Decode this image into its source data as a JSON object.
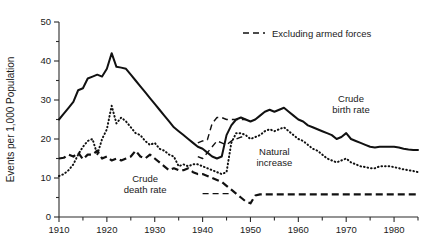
{
  "chart_data": {
    "type": "line",
    "title": "",
    "xlabel": "",
    "ylabel": "Events per 1,000 Population",
    "xlim": [
      1910,
      1985
    ],
    "ylim": [
      0,
      50
    ],
    "grid": false,
    "x_ticks_major": [
      1910,
      1920,
      1930,
      1940,
      1950,
      1960,
      1970,
      1980
    ],
    "x_ticks_minor": [
      1915,
      1925,
      1935,
      1945,
      1955,
      1965,
      1975,
      1985
    ],
    "y_ticks_major": [
      0,
      10,
      20,
      30,
      40,
      50
    ],
    "y_ticks_minor": [
      5,
      15,
      25,
      35,
      45
    ],
    "legend": {
      "position": "top-right",
      "entries": [
        {
          "label": "Excluding armed forces",
          "style": "dashed-thin"
        }
      ]
    },
    "annotations": [
      {
        "text": "Crude birth rate",
        "x": 1971,
        "y": 29.5
      },
      {
        "text": "Crude death rate",
        "x": 1928,
        "y": 9.0
      },
      {
        "text": "Natural increase",
        "x": 1955,
        "y": 16.0
      }
    ],
    "series": [
      {
        "name": "Crude birth rate",
        "style": "solid",
        "x": [
          1910,
          1911,
          1912,
          1913,
          1914,
          1915,
          1916,
          1917,
          1918,
          1919,
          1920,
          1921,
          1922,
          1923,
          1924,
          1925,
          1926,
          1927,
          1928,
          1929,
          1930,
          1931,
          1932,
          1933,
          1934,
          1935,
          1936,
          1937,
          1938,
          1939,
          1940,
          1941,
          1942,
          1943,
          1944,
          1945,
          1946,
          1947,
          1948,
          1949,
          1950,
          1951,
          1952,
          1953,
          1954,
          1955,
          1956,
          1957,
          1958,
          1959,
          1960,
          1961,
          1962,
          1963,
          1964,
          1965,
          1966,
          1967,
          1968,
          1969,
          1970,
          1971,
          1972,
          1973,
          1974,
          1975,
          1976,
          1977,
          1978,
          1979,
          1980,
          1981,
          1982,
          1983,
          1984,
          1985
        ],
        "values": [
          25.0,
          26.5,
          28.0,
          29.5,
          32.5,
          33.0,
          35.5,
          36.0,
          36.5,
          36.0,
          38.0,
          42.0,
          38.5,
          38.3,
          38.0,
          36.5,
          35.0,
          33.5,
          32.0,
          30.5,
          29.0,
          27.5,
          26.0,
          24.5,
          23.0,
          22.0,
          21.0,
          20.0,
          19.0,
          18.0,
          17.5,
          16.5,
          15.5,
          15.0,
          15.5,
          21.0,
          23.5,
          25.0,
          25.5,
          25.0,
          24.5,
          25.0,
          26.0,
          27.0,
          27.5,
          27.0,
          27.5,
          28.0,
          27.0,
          26.0,
          25.0,
          24.5,
          23.5,
          23.0,
          22.5,
          22.0,
          21.5,
          21.0,
          20.0,
          20.5,
          21.5,
          20.0,
          19.5,
          19.0,
          18.5,
          18.0,
          17.8,
          18.0,
          18.0,
          18.0,
          18.0,
          17.8,
          17.5,
          17.3,
          17.2,
          17.2
        ]
      },
      {
        "name": "Natural increase",
        "style": "dotted",
        "x": [
          1910,
          1911,
          1912,
          1913,
          1914,
          1915,
          1916,
          1917,
          1918,
          1919,
          1920,
          1921,
          1922,
          1923,
          1924,
          1925,
          1926,
          1927,
          1928,
          1929,
          1930,
          1931,
          1932,
          1933,
          1934,
          1935,
          1936,
          1937,
          1938,
          1939,
          1940,
          1941,
          1942,
          1943,
          1944,
          1945,
          1946,
          1947,
          1948,
          1949,
          1950,
          1951,
          1952,
          1953,
          1954,
          1955,
          1956,
          1957,
          1958,
          1959,
          1960,
          1961,
          1962,
          1963,
          1964,
          1965,
          1966,
          1967,
          1968,
          1969,
          1970,
          1971,
          1972,
          1973,
          1974,
          1975,
          1976,
          1977,
          1978,
          1979,
          1980,
          1981,
          1982,
          1983,
          1984,
          1985
        ],
        "values": [
          10.5,
          11.0,
          12.0,
          13.5,
          16.0,
          18.0,
          19.5,
          20.0,
          16.0,
          20.0,
          22.5,
          28.5,
          24.0,
          25.5,
          24.5,
          23.0,
          21.5,
          21.0,
          19.5,
          18.5,
          19.0,
          17.5,
          17.0,
          16.0,
          15.5,
          13.0,
          13.5,
          13.0,
          13.5,
          13.5,
          13.0,
          12.5,
          12.0,
          11.5,
          11.0,
          11.5,
          19.0,
          21.5,
          21.5,
          21.0,
          20.0,
          20.5,
          21.0,
          22.0,
          22.5,
          22.0,
          22.5,
          23.0,
          22.0,
          21.0,
          20.0,
          19.5,
          18.5,
          17.5,
          17.0,
          16.0,
          15.0,
          14.5,
          14.0,
          14.5,
          15.0,
          14.0,
          13.5,
          13.0,
          12.8,
          12.5,
          12.5,
          13.0,
          13.0,
          13.0,
          12.8,
          12.5,
          12.2,
          12.0,
          11.8,
          11.5
        ]
      },
      {
        "name": "Crude death rate",
        "style": "dashed",
        "x": [
          1910,
          1911,
          1912,
          1913,
          1914,
          1915,
          1916,
          1917,
          1918,
          1919,
          1920,
          1921,
          1922,
          1923,
          1924,
          1925,
          1926,
          1927,
          1928,
          1929,
          1930,
          1931,
          1932,
          1933,
          1934,
          1935,
          1936,
          1937,
          1938,
          1939,
          1940,
          1941,
          1942,
          1943,
          1944,
          1945,
          1946,
          1947,
          1948,
          1949,
          1950,
          1951,
          1952,
          1953,
          1954,
          1955,
          1956,
          1957,
          1958,
          1959,
          1960,
          1961,
          1962,
          1963,
          1964,
          1965,
          1966,
          1967,
          1968,
          1969,
          1970,
          1971,
          1972,
          1973,
          1974,
          1975,
          1976,
          1977,
          1978,
          1979,
          1980,
          1981,
          1982,
          1983,
          1984,
          1985
        ],
        "values": [
          15.0,
          15.2,
          16.0,
          15.5,
          16.5,
          14.8,
          16.0,
          16.0,
          17.0,
          15.0,
          15.5,
          14.5,
          15.0,
          14.5,
          15.0,
          15.5,
          17.0,
          15.5,
          15.0,
          16.0,
          15.0,
          14.0,
          13.0,
          12.0,
          12.5,
          12.0,
          12.0,
          12.5,
          11.5,
          11.0,
          11.0,
          10.5,
          10.0,
          9.5,
          9.0,
          8.0,
          7.0,
          6.0,
          5.0,
          4.0,
          3.5,
          5.5,
          5.8,
          5.8,
          5.8,
          5.8,
          5.8,
          5.8,
          5.8,
          5.8,
          5.8,
          5.8,
          5.8,
          5.8,
          5.8,
          5.8,
          5.8,
          5.8,
          5.8,
          5.8,
          5.8,
          5.8,
          5.8,
          5.8,
          5.8,
          5.8,
          5.8,
          5.8,
          5.8,
          5.8,
          5.8,
          5.8,
          5.8,
          5.8,
          5.8,
          5.8
        ]
      },
      {
        "name": "Crude birth rate (excluding armed forces)",
        "style": "dashed-thin",
        "x": [
          1939,
          1940,
          1941,
          1942,
          1943,
          1944,
          1945,
          1946,
          1947,
          1948,
          1949
        ],
        "values": [
          19.0,
          19.5,
          19.8,
          24.0,
          25.5,
          25.5,
          25.0,
          25.0,
          25.0,
          25.0,
          25.0
        ]
      },
      {
        "name": "Natural increase (excluding armed forces)",
        "style": "dashed-thin",
        "x": [
          1939,
          1940,
          1941,
          1942,
          1943,
          1944,
          1945,
          1946,
          1947,
          1948,
          1949
        ],
        "values": [
          15.5,
          15.0,
          16.5,
          18.0,
          19.5,
          19.0,
          18.5,
          19.5,
          20.0,
          20.5,
          20.5
        ]
      },
      {
        "name": "Crude death rate (excluding armed forces)",
        "style": "dashed-thin",
        "x": [
          1940,
          1941,
          1942,
          1943,
          1944,
          1945,
          1946
        ],
        "values": [
          6.0,
          6.0,
          6.0,
          6.0,
          6.0,
          6.0,
          6.0
        ]
      }
    ]
  }
}
